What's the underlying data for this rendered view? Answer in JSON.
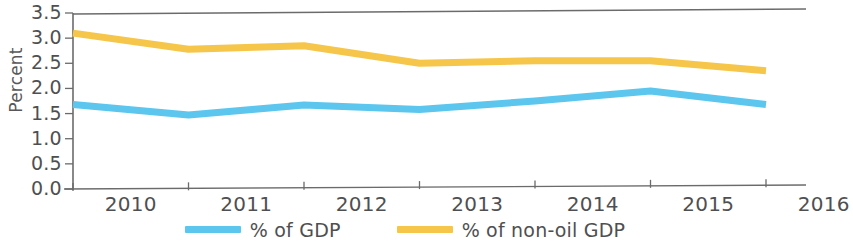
{
  "chart_data": {
    "type": "line",
    "title": "",
    "xlabel": "",
    "ylabel": "Percent",
    "categories": [
      "2010",
      "2011",
      "2012",
      "2013",
      "2014",
      "2015",
      "2016"
    ],
    "series": [
      {
        "name": "% of GDP",
        "color": "#5CC6EE",
        "values": [
          1.68,
          1.47,
          1.67,
          1.58,
          1.75,
          1.95,
          1.68
        ]
      },
      {
        "name": "% of non-oil GDP",
        "color": "#F6C64B",
        "values": [
          3.1,
          2.78,
          2.85,
          2.5,
          2.55,
          2.55,
          2.35
        ]
      }
    ],
    "ylim": [
      0.0,
      3.5
    ],
    "y_ticks": [
      "0.0",
      "0.5",
      "1.0",
      "1.5",
      "2.0",
      "2.5",
      "3.0",
      "3.5"
    ],
    "y_tick_values": [
      0.0,
      0.5,
      1.0,
      1.5,
      2.0,
      2.5,
      3.0,
      3.5
    ],
    "grid": false,
    "legend_position": "bottom",
    "axis_color": "#5a5a5a",
    "markers": false
  },
  "legend": {
    "entries": [
      {
        "label": "% of GDP",
        "color": "#5CC6EE"
      },
      {
        "label": "% of non-oil GDP",
        "color": "#F6C64B"
      }
    ]
  }
}
